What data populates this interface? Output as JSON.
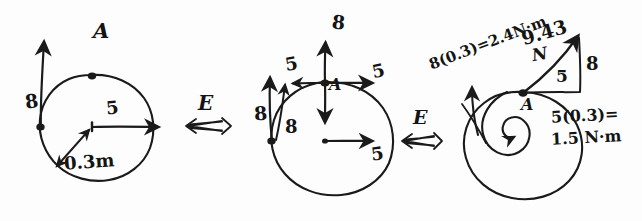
{
  "document": {
    "kind": "hand-drawn-mechanics-diagram",
    "title": "Force-couple equivalence on a disk",
    "background_color": "#fdfdfd",
    "ink_color": "#1a1a1a"
  },
  "equivalence_symbols": [
    {
      "letter": "E",
      "arrow": "double-headed-equivalence-arrow",
      "glyph": "⟺"
    },
    {
      "letter": "E",
      "arrow": "double-headed-equivalence-arrow",
      "glyph": "⟺"
    }
  ],
  "panels": [
    {
      "id": "panel-original",
      "labels": {
        "point_a": "A",
        "force_tangential": "8",
        "force_radial": "5",
        "radius": "0.3m"
      },
      "annotations": [
        {
          "name": "label-A",
          "text": "A"
        },
        {
          "name": "label-force-8",
          "text": "8"
        },
        {
          "name": "label-force-5",
          "text": "5"
        },
        {
          "name": "label-radius",
          "text": "0.3m"
        }
      ]
    },
    {
      "id": "panel-decomposed",
      "labels": {
        "point_a": "A",
        "up_force": "8",
        "down_force": "8",
        "left_force": "5",
        "right_force": "5",
        "left_point_force": "8",
        "left_point_force_2": "5",
        "center_force": "5"
      },
      "annotations": [
        {
          "name": "label-A",
          "text": "A"
        },
        {
          "name": "label-up-8",
          "text": "8"
        },
        {
          "name": "label-down-8",
          "text": "8"
        },
        {
          "name": "label-left-5",
          "text": "5"
        },
        {
          "name": "label-right-5",
          "text": "5"
        },
        {
          "name": "label-outer-8",
          "text": "8"
        },
        {
          "name": "label-outer-5",
          "text": "5"
        },
        {
          "name": "label-center-5",
          "text": "5"
        }
      ]
    },
    {
      "id": "panel-resultant",
      "labels": {
        "point_a": "A",
        "resultant": "9.43",
        "resultant_unit": "N",
        "triangle_horizontal": "5",
        "triangle_vertical": "8",
        "moment_left": "8(0.3)=2.4N·m",
        "moment_right_line1": "5(0.3)=",
        "moment_right_line2": "1.5 N·m"
      },
      "annotations": [
        {
          "name": "label-A",
          "text": "A"
        },
        {
          "name": "label-resultant",
          "text": "9.43"
        },
        {
          "name": "label-resultant-unit",
          "text": "N"
        },
        {
          "name": "label-triangle-base",
          "text": "5"
        },
        {
          "name": "label-triangle-height",
          "text": "8"
        },
        {
          "name": "label-moment-8",
          "text": "8(0.3)=2.4N·m"
        },
        {
          "name": "label-moment-5-a",
          "text": "5(0.3)="
        },
        {
          "name": "label-moment-5-b",
          "text": "1.5 N·m"
        }
      ]
    }
  ]
}
